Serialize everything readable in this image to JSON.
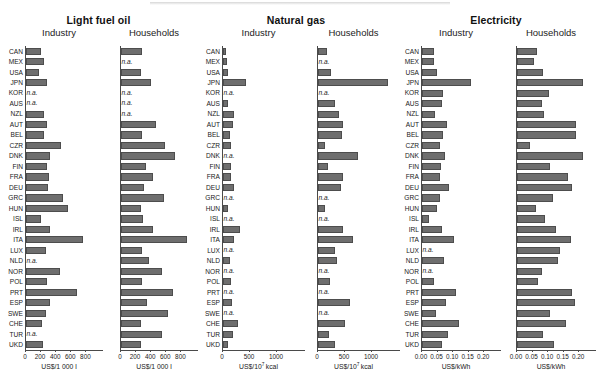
{
  "figure": {
    "background": "#ffffff",
    "bar_color": "#6e6e6e",
    "axis_color": "#4a4a4a",
    "na_text": "n.a.",
    "countries": [
      "CAN",
      "MEX",
      "USA",
      "JPN",
      "KOR",
      "AUS",
      "NZL",
      "AUT",
      "BEL",
      "CZR",
      "DNK",
      "FIN",
      "FRA",
      "DEU",
      "GRC",
      "HUN",
      "ISL",
      "IRL",
      "ITA",
      "LUX",
      "NLD",
      "NOR",
      "POL",
      "PRT",
      "ESP",
      "SWE",
      "CHE",
      "TUR",
      "UKD"
    ],
    "groups": [
      {
        "title": "Light fuel oil",
        "panels": [
          "Industry",
          "Households"
        ]
      },
      {
        "title": "Natural gas",
        "panels": [
          "Industry",
          "Households"
        ]
      },
      {
        "title": "Electricity",
        "panels": [
          "Industry",
          "Households"
        ]
      }
    ]
  },
  "chart_data": [
    {
      "type": "bar",
      "title": "Light fuel oil",
      "subtitle": "Industry",
      "orientation": "horizontal",
      "xlabel": "US$/1 000 l",
      "xlabel_plain": "US$/1 000 l",
      "xlim": [
        0,
        900
      ],
      "ticks": [
        0,
        200,
        400,
        600,
        800
      ],
      "tick_labels": [
        "0",
        "200",
        "400",
        "600",
        "800"
      ],
      "grid": false,
      "categories": [
        "CAN",
        "MEX",
        "USA",
        "JPN",
        "KOR",
        "AUS",
        "NZL",
        "AUT",
        "BEL",
        "CZR",
        "DNK",
        "FIN",
        "FRA",
        "DEU",
        "GRC",
        "HUN",
        "ISL",
        "IRL",
        "ITA",
        "LUX",
        "NLD",
        "NOR",
        "POL",
        "PRT",
        "ESP",
        "SWE",
        "CHE",
        "TUR",
        "UKD"
      ],
      "values": [
        205,
        240,
        180,
        290,
        null,
        null,
        250,
        285,
        250,
        470,
        330,
        290,
        315,
        300,
        490,
        565,
        200,
        330,
        765,
        270,
        null,
        450,
        290,
        680,
        320,
        265,
        215,
        null,
        225
      ]
    },
    {
      "type": "bar",
      "title": "Light fuel oil",
      "subtitle": "Households",
      "orientation": "horizontal",
      "xlabel": "US$/1 000 l",
      "xlabel_plain": "US$/1 000 l",
      "xlim": [
        0,
        900
      ],
      "ticks": [
        0,
        200,
        400,
        600,
        800
      ],
      "tick_labels": [
        "0",
        "200",
        "400",
        "600",
        "800"
      ],
      "grid": false,
      "categories": [
        "CAN",
        "MEX",
        "USA",
        "JPN",
        "KOR",
        "AUS",
        "NZL",
        "AUT",
        "BEL",
        "CZR",
        "DNK",
        "FIN",
        "FRA",
        "DEU",
        "GRC",
        "HUN",
        "ISL",
        "IRL",
        "ITA",
        "LUX",
        "NLD",
        "NOR",
        "POL",
        "PRT",
        "ESP",
        "SWE",
        "CHE",
        "TUR",
        "UKD"
      ],
      "values": [
        285,
        null,
        275,
        405,
        null,
        null,
        null,
        465,
        285,
        585,
        715,
        340,
        430,
        310,
        575,
        265,
        300,
        430,
        885,
        285,
        375,
        545,
        285,
        700,
        355,
        630,
        265,
        550,
        265
      ]
    },
    {
      "type": "bar",
      "title": "Natural gas",
      "subtitle": "Industry",
      "orientation": "horizontal",
      "xlabel": "US$/10^7 kcal",
      "xlabel_plain": "US$/10⁷ kcal",
      "xlim": [
        0,
        1350
      ],
      "ticks": [
        0,
        500,
        1000
      ],
      "tick_labels": [
        "0",
        "500",
        "1000"
      ],
      "grid": false,
      "categories": [
        "CAN",
        "MEX",
        "USA",
        "JPN",
        "KOR",
        "AUS",
        "NZL",
        "AUT",
        "BEL",
        "CZR",
        "DNK",
        "FIN",
        "FRA",
        "DEU",
        "GRC",
        "HUN",
        "ISL",
        "IRL",
        "ITA",
        "LUX",
        "NLD",
        "NOR",
        "POL",
        "PRT",
        "ESP",
        "SWE",
        "CHE",
        "TUR",
        "UKD"
      ],
      "values": [
        60,
        85,
        105,
        430,
        null,
        100,
        215,
        200,
        130,
        165,
        null,
        160,
        165,
        205,
        null,
        100,
        null,
        320,
        205,
        null,
        140,
        null,
        155,
        null,
        180,
        null,
        285,
        195,
        105
      ]
    },
    {
      "type": "bar",
      "title": "Natural gas",
      "subtitle": "Households",
      "orientation": "horizontal",
      "xlabel": "US$/10^7 kcal",
      "xlabel_plain": "US$/10⁷ kcal",
      "xlim": [
        0,
        1350
      ],
      "ticks": [
        0,
        500,
        1000
      ],
      "tick_labels": [
        "0",
        "500",
        "1000"
      ],
      "grid": false,
      "categories": [
        "CAN",
        "MEX",
        "USA",
        "JPN",
        "KOR",
        "AUS",
        "NZL",
        "AUT",
        "BEL",
        "CZR",
        "DNK",
        "FIN",
        "FRA",
        "DEU",
        "GRC",
        "HUN",
        "ISL",
        "IRL",
        "ITA",
        "LUX",
        "NLD",
        "NOR",
        "POL",
        "PRT",
        "ESP",
        "SWE",
        "CHE",
        "TUR",
        "UKD"
      ],
      "values": [
        175,
        null,
        255,
        1300,
        null,
        330,
        400,
        470,
        455,
        140,
        740,
        195,
        470,
        440,
        null,
        130,
        null,
        465,
        650,
        320,
        360,
        null,
        240,
        null,
        610,
        null,
        500,
        215,
        320
      ]
    },
    {
      "type": "bar",
      "title": "Electricity",
      "subtitle": "Industry",
      "orientation": "horizontal",
      "xlabel": "US$/kWh",
      "xlabel_plain": "US$/kWh",
      "xlim": [
        0,
        0.225
      ],
      "ticks": [
        0.0,
        0.05,
        0.1,
        0.15,
        0.2
      ],
      "tick_labels": [
        "0.00",
        "0.05",
        "0.10",
        "0.15",
        "0.20"
      ],
      "grid": false,
      "categories": [
        "CAN",
        "MEX",
        "USA",
        "JPN",
        "KOR",
        "AUS",
        "NZL",
        "AUT",
        "BEL",
        "CZR",
        "DNK",
        "FIN",
        "FRA",
        "DEU",
        "GRC",
        "HUN",
        "ISL",
        "IRL",
        "ITA",
        "LUX",
        "NLD",
        "NOR",
        "POL",
        "PRT",
        "ESP",
        "SWE",
        "CHE",
        "TUR",
        "UKD"
      ],
      "values": [
        0.041,
        0.041,
        0.049,
        0.16,
        0.069,
        0.066,
        0.044,
        0.083,
        0.069,
        0.061,
        0.075,
        0.063,
        0.058,
        0.089,
        0.061,
        0.05,
        0.025,
        0.067,
        0.104,
        null,
        0.072,
        null,
        0.041,
        0.112,
        0.08,
        0.045,
        0.121,
        0.086,
        0.066
      ]
    },
    {
      "type": "bar",
      "title": "Electricity",
      "subtitle": "Households",
      "orientation": "horizontal",
      "xlabel": "US$/kWh",
      "xlabel_plain": "US$/kWh",
      "xlim": [
        0,
        0.225
      ],
      "ticks": [
        0.0,
        0.05,
        0.1,
        0.15,
        0.2
      ],
      "tick_labels": [
        "0.00",
        "0.05",
        "0.10",
        "0.15",
        "0.20"
      ],
      "grid": false,
      "categories": [
        "CAN",
        "MEX",
        "USA",
        "JPN",
        "KOR",
        "AUS",
        "NZL",
        "AUT",
        "BEL",
        "CZR",
        "DNK",
        "FIN",
        "FRA",
        "DEU",
        "GRC",
        "HUN",
        "ISL",
        "IRL",
        "ITA",
        "LUX",
        "NLD",
        "NOR",
        "POL",
        "PRT",
        "ESP",
        "SWE",
        "CHE",
        "TUR",
        "UKD"
      ],
      "values": [
        0.066,
        0.057,
        0.086,
        0.213,
        0.106,
        0.083,
        0.088,
        0.192,
        0.19,
        0.042,
        0.214,
        0.108,
        0.165,
        0.179,
        0.116,
        0.063,
        0.092,
        0.128,
        0.174,
        0.14,
        0.133,
        0.081,
        0.069,
        0.178,
        0.189,
        0.108,
        0.159,
        0.086,
        0.122
      ]
    }
  ]
}
